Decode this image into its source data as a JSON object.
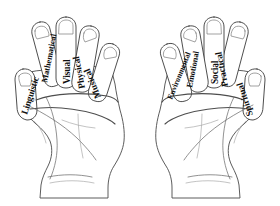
{
  "figure": {
    "type": "labeled-anatomy-diagram",
    "background_color": "#ffffff",
    "line_color": "#3a3a3a",
    "label_color": "#101010"
  },
  "hands": [
    {
      "id": "left-hand",
      "name": "left-hand",
      "digits": [
        {
          "id": "left-thumb",
          "digit": "thumb",
          "label": "Linguistic",
          "angle": -72
        },
        {
          "id": "left-index",
          "digit": "index finger",
          "label": "Mathematical",
          "angle": -79
        },
        {
          "id": "left-middle",
          "digit": "middle finger",
          "label": "Visual",
          "angle": -90
        },
        {
          "id": "left-ring",
          "digit": "ring finger",
          "label": "Physical",
          "angle": -101
        },
        {
          "id": "left-pinky",
          "digit": "little finger",
          "label": "Musical",
          "angle": -112
        }
      ]
    },
    {
      "id": "right-hand",
      "name": "right-hand",
      "digits": [
        {
          "id": "right-pinky",
          "digit": "little finger",
          "label": "Environmental",
          "angle": -68
        },
        {
          "id": "right-ring",
          "digit": "ring finger",
          "label": "Emotional",
          "angle": -79
        },
        {
          "id": "right-middle",
          "digit": "middle finger",
          "label": "Social",
          "angle": -90
        },
        {
          "id": "right-index",
          "digit": "index finger",
          "label": "Practical",
          "angle": -101
        },
        {
          "id": "right-thumb",
          "digit": "thumb",
          "label": "Spiritual",
          "angle": -108
        }
      ]
    }
  ]
}
